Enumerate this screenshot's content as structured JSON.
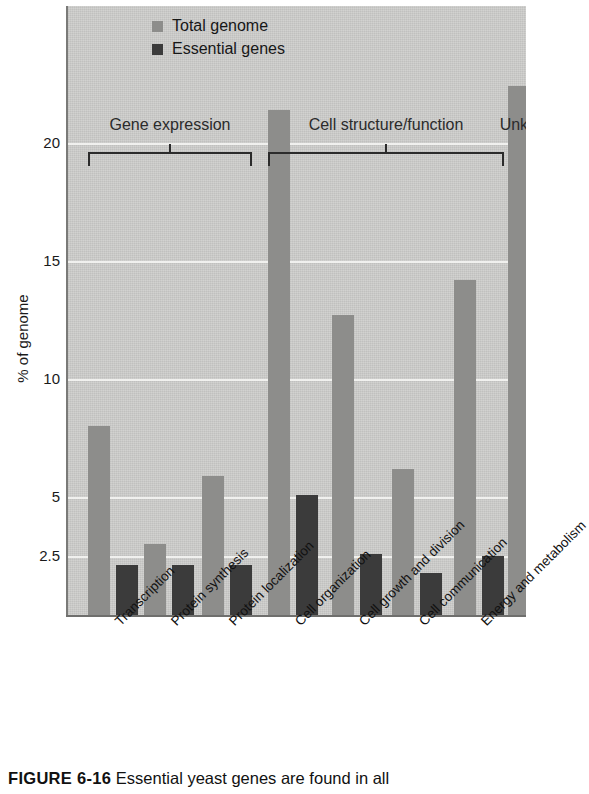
{
  "figure": {
    "caption_label": "FIGURE 6-16",
    "caption_text": "Essential yeast genes are found in all"
  },
  "legend": {
    "position": "top-left",
    "items": [
      {
        "label": "Total genome",
        "color": "#8d8d8b",
        "key": "total"
      },
      {
        "label": "Essential genes",
        "color": "#3b3b3b",
        "key": "essential"
      }
    ]
  },
  "axes": {
    "ylabel": "% of genome",
    "yticks": [
      "2.5",
      "5",
      "10",
      "15",
      "20"
    ],
    "ytick_values": [
      2.5,
      5,
      10,
      15,
      20
    ],
    "ylim": [
      0,
      24
    ],
    "grid": true
  },
  "groups": [
    {
      "title": "Gene expression",
      "categories": [
        0,
        1,
        2
      ]
    },
    {
      "title": "Cell structure/function",
      "categories": [
        3,
        4,
        5,
        6
      ]
    },
    {
      "title": "Unknown",
      "categories": [
        7
      ]
    }
  ],
  "chart_data": {
    "type": "bar",
    "title": "",
    "xlabel": "",
    "ylabel": "% of genome",
    "ylim": [
      0,
      24
    ],
    "grid": true,
    "legend_position": "top-left",
    "categories": [
      "Transcription",
      "Protein synthesis",
      "Protein localization",
      "Cell organization",
      "Cell growth and division",
      "Cell communication",
      "Energy and metabolism",
      "Unknown"
    ],
    "series": [
      {
        "name": "Total genome",
        "color": "#8d8d8b",
        "values": [
          8.0,
          3.0,
          5.9,
          21.4,
          12.7,
          6.2,
          14.2,
          22.4
        ]
      },
      {
        "name": "Essential genes",
        "color": "#3b3b3b",
        "values": [
          2.1,
          2.1,
          2.1,
          5.1,
          2.6,
          1.8,
          2.5,
          2.4
        ]
      }
    ],
    "group_brackets": [
      {
        "label": "Gene expression",
        "spans": [
          0,
          2
        ]
      },
      {
        "label": "Cell structure/function",
        "spans": [
          3,
          6
        ]
      },
      {
        "label": "Unknown",
        "spans": [
          7,
          7
        ]
      }
    ]
  }
}
